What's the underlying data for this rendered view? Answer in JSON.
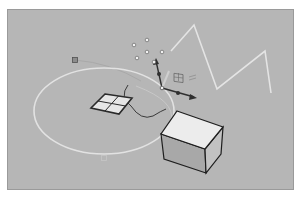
{
  "app": {
    "type": "3d-modeling-viewport"
  },
  "viewport": {
    "name": "Perspective",
    "background": "#b6b6b6",
    "border": "#9a9a9a"
  },
  "scene": {
    "control_points": [
      {
        "x": 133,
        "y": 44
      },
      {
        "x": 146,
        "y": 39
      },
      {
        "x": 146,
        "y": 51
      },
      {
        "x": 136,
        "y": 57
      },
      {
        "x": 161,
        "y": 51
      },
      {
        "x": 153,
        "y": 61
      }
    ],
    "polyline": {
      "points": "170,50 193,24 216,88 264,50 270,92",
      "color": "#e4e4e4"
    },
    "ellipse": {
      "cx": 103,
      "cy": 110,
      "rx": 70,
      "ry": 43,
      "color": "#e2e2e2"
    },
    "plane": {
      "corners": "104,93 131,97 118,113 90,107",
      "fill": "#e6e6e6",
      "edge": "#2a2a2a"
    },
    "box": {
      "top": "176,110 222,126 204,148 160,133",
      "front": "160,133 204,148 205,172 163,158",
      "right": "204,148 222,126 220,153 205,172",
      "top_fill": "#ececec",
      "front_fill": "#a8a8a8",
      "right_fill": "#c2c2c2",
      "edge": "#1e1e1e"
    },
    "gumball": {
      "origin": {
        "x": 161,
        "y": 87
      },
      "color": "#2f2f2f"
    },
    "markers": [
      {
        "name": "point-marker",
        "x": 74,
        "y": 59
      },
      {
        "name": "point-marker-faint",
        "x": 103,
        "y": 157
      }
    ]
  }
}
